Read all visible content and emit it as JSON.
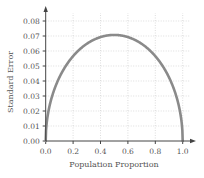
{
  "chart_data": {
    "type": "line",
    "title": "",
    "xlabel": "Population Proportion",
    "ylabel": "Standard Error",
    "xlim": [
      0.0,
      1.0
    ],
    "ylim": [
      0.0,
      0.08
    ],
    "xticks": [
      "0.0",
      "0.2",
      "0.4",
      "0.6",
      "0.8",
      "1.0"
    ],
    "yticks": [
      "0.00",
      "0.01",
      "0.02",
      "0.03",
      "0.04",
      "0.05",
      "0.06",
      "0.07",
      "0.08"
    ],
    "grid": true,
    "legend": null,
    "series": [
      {
        "name": "Standard Error",
        "formula": "sqrt(p*(1-p)/50)",
        "x": [
          0.0,
          0.05,
          0.1,
          0.2,
          0.3,
          0.4,
          0.5,
          0.6,
          0.7,
          0.8,
          0.9,
          0.95,
          1.0
        ],
        "y": [
          0.0,
          0.0308,
          0.0424,
          0.0566,
          0.0648,
          0.0693,
          0.0707,
          0.0693,
          0.0648,
          0.0566,
          0.0424,
          0.0308,
          0.0
        ],
        "color": "#8a8a8a"
      }
    ]
  },
  "colors": {
    "curve": "#8a8a8a",
    "axis": "#444444",
    "grid": "#cfcfcf",
    "text": "#555555"
  }
}
